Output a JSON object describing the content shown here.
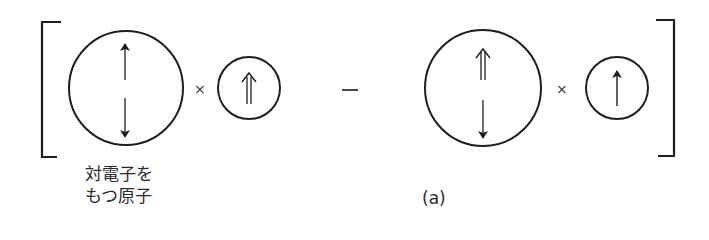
{
  "figure": {
    "caption": "(a)",
    "operators": {
      "times_1": "×",
      "minus": "−",
      "times_2": "×"
    },
    "term_1": {
      "large_atom": {
        "spins": [
          "up",
          "down"
        ],
        "label_line_1": "対電子を",
        "label_line_2": "もつ原子"
      },
      "small_atom": {
        "spins": [
          "double-up"
        ]
      }
    },
    "term_2": {
      "large_atom": {
        "spins": [
          "double-up",
          "down"
        ]
      },
      "small_atom": {
        "spins": [
          "up"
        ]
      }
    },
    "colors": {
      "stroke": "#1e1e1e",
      "background": "#ffffff"
    }
  }
}
